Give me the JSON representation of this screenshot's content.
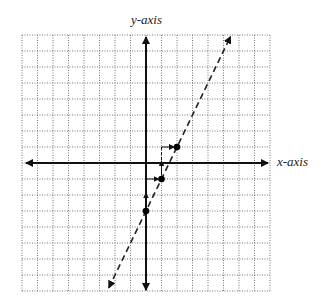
{
  "labels": {
    "y_axis": "y-axis",
    "x_axis": "x-axis"
  },
  "grid": {
    "xmin": -8,
    "xmax": 8,
    "ymin": -8,
    "ymax": 8,
    "left": 22,
    "top": 35,
    "cell_w": 15.5,
    "cell_h": 16
  },
  "line": {
    "equation": "y = 2x - 3",
    "slope": 2,
    "intercept": -3,
    "style": "dashed",
    "x_start": -2.4,
    "x_end": 5.45
  },
  "points": [
    {
      "x": 0,
      "y": -3
    },
    {
      "x": 1,
      "y": -1
    },
    {
      "x": 2,
      "y": 1
    }
  ],
  "steps": [
    {
      "from": [
        0,
        -3
      ],
      "rise": 2,
      "run": 1
    },
    {
      "from": [
        1,
        -1
      ],
      "rise": 2,
      "run": 1
    }
  ],
  "colors": {
    "grid": "#777777",
    "axis": "#111111",
    "line": "#222222"
  }
}
